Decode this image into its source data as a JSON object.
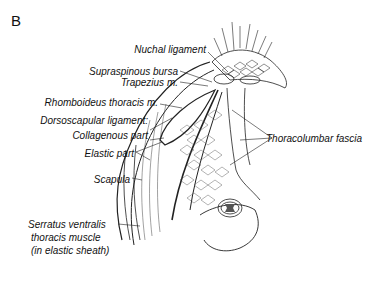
{
  "figure": {
    "panel_label": "B",
    "labels": {
      "nuchal_ligament": "Nuchal ligament",
      "supraspinous_bursa": "Supraspinous bursa",
      "trapezius": "Trapezius m.",
      "rhomboideus": "Rhomboideus thoracis m.",
      "dorsoscapular": "Dorsoscapular ligament:",
      "collagenous": "Collagenous part",
      "elastic": "Elastic part",
      "scapula": "Scapula",
      "serratus_1": "Serratus ventralis",
      "serratus_2": "thoracis muscle",
      "serratus_3": "(in elastic sheath)",
      "thoracolumbar": "Thoracolumbar fascia"
    }
  }
}
